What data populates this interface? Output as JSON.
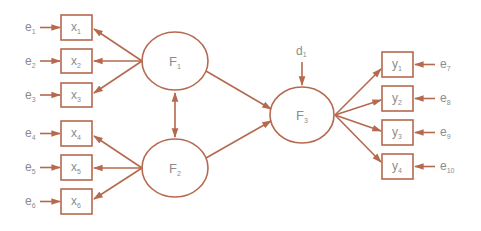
{
  "diagram": {
    "type": "structural-equation-model",
    "colors": {
      "stroke": "#b5694e",
      "text": "#8c8c8c",
      "background": "#ffffff"
    },
    "latent_factors": [
      {
        "id": "F1",
        "base": "F",
        "sub": "1"
      },
      {
        "id": "F2",
        "base": "F",
        "sub": "2"
      },
      {
        "id": "F3",
        "base": "F",
        "sub": "3"
      }
    ],
    "indicators": [
      {
        "id": "x1",
        "base": "x",
        "sub": "1",
        "error": {
          "base": "e",
          "sub": "1"
        },
        "factor": "F1"
      },
      {
        "id": "x2",
        "base": "x",
        "sub": "2",
        "error": {
          "base": "e",
          "sub": "2"
        },
        "factor": "F1"
      },
      {
        "id": "x3",
        "base": "x",
        "sub": "3",
        "error": {
          "base": "e",
          "sub": "3"
        },
        "factor": "F1"
      },
      {
        "id": "x4",
        "base": "x",
        "sub": "4",
        "error": {
          "base": "e",
          "sub": "4"
        },
        "factor": "F2"
      },
      {
        "id": "x5",
        "base": "x",
        "sub": "5",
        "error": {
          "base": "e",
          "sub": "5"
        },
        "factor": "F2"
      },
      {
        "id": "x6",
        "base": "x",
        "sub": "6",
        "error": {
          "base": "e",
          "sub": "6"
        },
        "factor": "F2"
      },
      {
        "id": "y1",
        "base": "y",
        "sub": "1",
        "error": {
          "base": "e",
          "sub": "7"
        },
        "factor": "F3"
      },
      {
        "id": "y2",
        "base": "y",
        "sub": "2",
        "error": {
          "base": "e",
          "sub": "8"
        },
        "factor": "F3"
      },
      {
        "id": "y3",
        "base": "y",
        "sub": "3",
        "error": {
          "base": "e",
          "sub": "9"
        },
        "factor": "F3"
      },
      {
        "id": "y4",
        "base": "y",
        "sub": "4",
        "error": {
          "base": "e",
          "sub": "10"
        },
        "factor": "F3"
      }
    ],
    "disturbance": {
      "base": "d",
      "sub": "1",
      "target": "F3"
    },
    "paths": [
      {
        "from": "F1",
        "to": "F3",
        "type": "directed"
      },
      {
        "from": "F2",
        "to": "F3",
        "type": "directed"
      },
      {
        "from": "F1",
        "to": "F2",
        "type": "covariance"
      }
    ]
  }
}
